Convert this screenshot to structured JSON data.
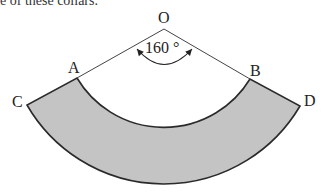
{
  "caption": "e of these collars.",
  "diagram": {
    "points": {
      "O": {
        "label": "O",
        "x": 164,
        "y": 29
      },
      "A": {
        "label": "A",
        "x": 77,
        "y": 78
      },
      "B": {
        "label": "B",
        "x": 250,
        "y": 79
      },
      "C": {
        "label": "C",
        "x": 27,
        "y": 105
      },
      "D": {
        "label": "D",
        "x": 300,
        "y": 106
      }
    },
    "angle_label": "160 °",
    "fill_color": "#c4c4c4",
    "stroke_color": "#2a2a2a"
  }
}
